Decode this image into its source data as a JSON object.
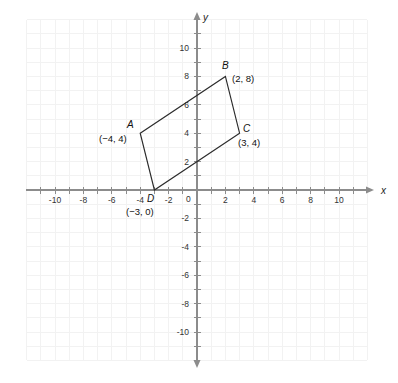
{
  "figure": {
    "background_color": "#ffffff",
    "grid_color": "#f2f2f2",
    "axis_color": "#8c8c8c",
    "shape_color": "#2b2b2b",
    "text_color": "#111111"
  },
  "axes": {
    "x_label": "x",
    "y_label": "y",
    "origin_label": "0",
    "x_range": [
      -11,
      11
    ],
    "y_range": [
      -11,
      11
    ],
    "tick_step": 2,
    "grid": true,
    "x_ticks": [
      {
        "value": -10,
        "label": "-10"
      },
      {
        "value": -8,
        "label": "-8"
      },
      {
        "value": -6,
        "label": "-6"
      },
      {
        "value": -4,
        "label": "-4"
      },
      {
        "value": -2,
        "label": "-2"
      },
      {
        "value": 2,
        "label": "2"
      },
      {
        "value": 4,
        "label": "4"
      },
      {
        "value": 6,
        "label": "6"
      },
      {
        "value": 8,
        "label": "8"
      },
      {
        "value": 10,
        "label": "10"
      }
    ],
    "y_ticks": [
      {
        "value": 10,
        "label": "10"
      },
      {
        "value": 8,
        "label": "8"
      },
      {
        "value": 6,
        "label": "6"
      },
      {
        "value": 4,
        "label": "4"
      },
      {
        "value": 2,
        "label": "2"
      },
      {
        "value": -2,
        "label": "-2"
      },
      {
        "value": -4,
        "label": "-4"
      },
      {
        "value": -6,
        "label": "-6"
      },
      {
        "value": -8,
        "label": "-8"
      },
      {
        "value": -10,
        "label": "-10"
      }
    ]
  },
  "chart_data": {
    "type": "scatter",
    "xlabel": "x",
    "ylabel": "y",
    "xlim": [
      -11,
      11
    ],
    "ylim": [
      -11,
      11
    ],
    "grid": true,
    "legend": "none",
    "shapes": [
      {
        "name": "parallelogram-abcd",
        "closed": true,
        "vertices": [
          {
            "name": "A",
            "x": -4,
            "y": 4,
            "coord_label": "(−4, 4)",
            "letter_label": "A"
          },
          {
            "name": "B",
            "x": 2,
            "y": 8,
            "coord_label": "(2, 8)",
            "letter_label": "B"
          },
          {
            "name": "C",
            "x": 3,
            "y": 4,
            "coord_label": "(3, 4)",
            "letter_label": "C"
          },
          {
            "name": "D",
            "x": -3,
            "y": 0,
            "coord_label": "(−3, 0)",
            "letter_label": "D"
          }
        ]
      }
    ]
  },
  "labels": {
    "a_letter": "A",
    "a_coord": "(−4, 4)",
    "b_letter": "B",
    "b_coord": "(2, 8)",
    "c_letter": "C",
    "c_coord": "(3, 4)",
    "d_letter": "D",
    "d_coord": "(−3, 0)"
  }
}
